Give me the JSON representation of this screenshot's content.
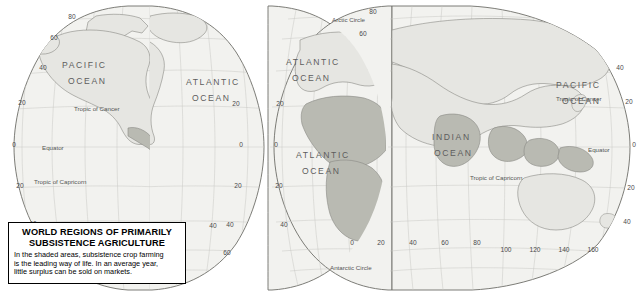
{
  "legend": {
    "title_line1": "WORLD REGIONS OF PRIMARILY",
    "title_line2": "SUBSISTENCE AGRICULTURE",
    "body_line1": "In the shaded areas, subsistence crop farming",
    "body_line2": "is the leading way of life.  In an average year,",
    "body_line3": "little surplus can be sold on markets."
  },
  "colors": {
    "land_fill": "#e6e6e2",
    "land_stroke": "#8a8a85",
    "shaded_region": "#b9bab2",
    "graticule": "#c9c9c4",
    "ocean_text": "#5d5d5d",
    "label_text": "#4a4a4a",
    "border_line": "#000000",
    "background": "#ffffff"
  },
  "ocean_labels": [
    {
      "id": "pacific-ocean-west",
      "line1": "PACIFIC",
      "line2": "OCEAN",
      "x": 62,
      "y": 68
    },
    {
      "id": "atlantic-ocean-north",
      "line1": "ATLANTIC",
      "line2": "OCEAN",
      "x": 186,
      "y": 85
    },
    {
      "id": "atlantic-ocean-northeast",
      "line1": "ATLANTIC",
      "line2": "OCEAN",
      "x": 286,
      "y": 65
    },
    {
      "id": "atlantic-ocean-south",
      "line1": "ATLANTIC",
      "line2": "OCEAN",
      "x": 304,
      "y": 158
    },
    {
      "id": "indian-ocean",
      "line1": "INDIAN",
      "line2": "OCEAN",
      "x": 436,
      "y": 140
    },
    {
      "id": "pacific-ocean-east",
      "line1": "PACIFIC",
      "line2": "OCEAN",
      "x": 556,
      "y": 88
    }
  ],
  "reference_lines": [
    {
      "id": "tropic-of-cancer-west",
      "label": "Tropic of Cancer",
      "x": 74,
      "y": 111
    },
    {
      "id": "equator-west",
      "label": "Equator",
      "x": 46,
      "y": 148
    },
    {
      "id": "tropic-of-capricorn-west",
      "label": "Tropic of Capricorn",
      "x": 36,
      "y": 182
    },
    {
      "id": "arctic-circle-north",
      "label": "Arctic Circle",
      "x": 339,
      "y": 23
    },
    {
      "id": "antarctic-circle",
      "label": "Antarctic Circle",
      "x": 354,
      "y": 268
    },
    {
      "id": "tropic-of-cancer-east",
      "label": "Tropic of Cancer",
      "x": 560,
      "y": 100
    },
    {
      "id": "equator-east",
      "label": "Equator",
      "x": 588,
      "y": 151
    },
    {
      "id": "tropic-of-capricorn-east",
      "label": "Tropic of Capricorn",
      "x": 474,
      "y": 182
    }
  ],
  "latitude_labels": [
    "80",
    "60",
    "40",
    "20",
    "0",
    "20",
    "40",
    "60",
    "80"
  ],
  "longitude_labels_left": [
    "80",
    "60",
    "40",
    "20"
  ],
  "longitude_labels_right": [
    "20",
    "40",
    "60",
    "80",
    "100",
    "120",
    "140",
    "160"
  ],
  "graticule_numbers": [
    {
      "v": "80",
      "x": 72,
      "y": 19
    },
    {
      "v": "60",
      "x": 54,
      "y": 40
    },
    {
      "v": "40",
      "x": 43,
      "y": 70
    },
    {
      "v": "20",
      "x": 22,
      "y": 105
    },
    {
      "v": "0",
      "x": 14,
      "y": 147
    },
    {
      "v": "20",
      "x": 20,
      "y": 188
    },
    {
      "v": "40",
      "x": 33,
      "y": 226
    },
    {
      "v": "60",
      "x": 59,
      "y": 254
    },
    {
      "v": "80",
      "x": 90,
      "y": 272
    },
    {
      "v": "20",
      "x": 236,
      "y": 106
    },
    {
      "v": "0",
      "x": 241,
      "y": 147
    },
    {
      "v": "20",
      "x": 238,
      "y": 188
    },
    {
      "v": "40",
      "x": 230,
      "y": 227
    },
    {
      "v": "20",
      "x": 280,
      "y": 106
    },
    {
      "v": "0",
      "x": 276,
      "y": 147
    },
    {
      "v": "20",
      "x": 279,
      "y": 188
    },
    {
      "v": "40",
      "x": 284,
      "y": 227
    },
    {
      "v": "80",
      "x": 373,
      "y": 14
    },
    {
      "v": "60",
      "x": 363,
      "y": 36
    },
    {
      "v": "0",
      "x": 352,
      "y": 245
    },
    {
      "v": "20",
      "x": 381,
      "y": 245
    },
    {
      "v": "40",
      "x": 413,
      "y": 245
    },
    {
      "v": "60",
      "x": 445,
      "y": 245
    },
    {
      "v": "80",
      "x": 477,
      "y": 245
    },
    {
      "v": "100",
      "x": 506,
      "y": 252
    },
    {
      "v": "120",
      "x": 535,
      "y": 252
    },
    {
      "v": "140",
      "x": 564,
      "y": 252
    },
    {
      "v": "160",
      "x": 593,
      "y": 252
    },
    {
      "v": "40",
      "x": 213,
      "y": 228
    },
    {
      "v": "60",
      "x": 227,
      "y": 255
    },
    {
      "v": "40",
      "x": 627,
      "y": 224
    },
    {
      "v": "20",
      "x": 631,
      "y": 190
    },
    {
      "v": "0",
      "x": 634,
      "y": 147
    },
    {
      "v": "20",
      "x": 629,
      "y": 104
    },
    {
      "v": "40",
      "x": 620,
      "y": 70
    }
  ]
}
